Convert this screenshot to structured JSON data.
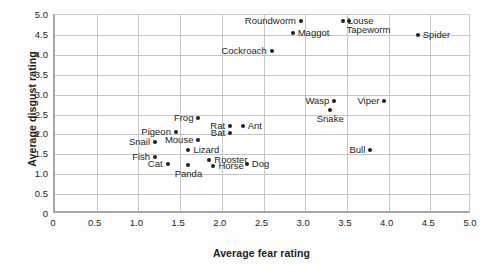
{
  "chart_data": {
    "type": "scatter",
    "title": "",
    "xlabel": "Average fear rating",
    "ylabel": "Average disgust rating",
    "xlim": [
      0,
      5.0
    ],
    "ylim": [
      0,
      5.0
    ],
    "grid": true,
    "legend": "none",
    "xticks": [
      "0",
      "0.5",
      "1.0",
      "1.5",
      "2.0",
      "2.5",
      "3.0",
      "3.5",
      "4.0",
      "4.5",
      "5.0"
    ],
    "xtick_values": [
      0,
      0.5,
      1.0,
      1.5,
      2.0,
      2.5,
      3.0,
      3.5,
      4.0,
      4.5,
      5.0
    ],
    "yticks": [
      "0",
      "0.5",
      "1.0",
      "1.5",
      "2.0",
      "2.5",
      "3.0",
      "3.5",
      "4.0",
      "4.5",
      "5.0"
    ],
    "ytick_values": [
      0,
      0.5,
      1.0,
      1.5,
      2.0,
      2.5,
      3.0,
      3.5,
      4.0,
      4.5,
      5.0
    ],
    "point_color": "#231f20",
    "points": [
      {
        "label": "Roundworm",
        "x": 2.95,
        "y": 4.85,
        "label_pos": "left"
      },
      {
        "label": "Louse",
        "x": 3.45,
        "y": 4.85,
        "label_pos": "right"
      },
      {
        "label": "Tapeworm",
        "x": 3.52,
        "y": 4.85,
        "label_pos": "below-right"
      },
      {
        "label": "Maggot",
        "x": 2.85,
        "y": 4.55,
        "label_pos": "right"
      },
      {
        "label": "Spider",
        "x": 4.35,
        "y": 4.5,
        "label_pos": "right"
      },
      {
        "label": "Cockroach",
        "x": 2.6,
        "y": 4.1,
        "label_pos": "left"
      },
      {
        "label": "Wasp",
        "x": 3.35,
        "y": 2.85,
        "label_pos": "left"
      },
      {
        "label": "Viper",
        "x": 3.95,
        "y": 2.85,
        "label_pos": "left"
      },
      {
        "label": "Snake",
        "x": 3.3,
        "y": 2.62,
        "label_pos": "below"
      },
      {
        "label": "Frog",
        "x": 1.72,
        "y": 2.4,
        "label_pos": "left"
      },
      {
        "label": "Rat",
        "x": 2.1,
        "y": 2.2,
        "label_pos": "left"
      },
      {
        "label": "Ant",
        "x": 2.25,
        "y": 2.2,
        "label_pos": "right"
      },
      {
        "label": "Bat",
        "x": 2.1,
        "y": 2.03,
        "label_pos": "left"
      },
      {
        "label": "Pigeon",
        "x": 1.45,
        "y": 2.05,
        "label_pos": "left"
      },
      {
        "label": "Mouse",
        "x": 1.72,
        "y": 1.85,
        "label_pos": "left"
      },
      {
        "label": "Snail",
        "x": 1.2,
        "y": 1.8,
        "label_pos": "left"
      },
      {
        "label": "Lizard",
        "x": 1.6,
        "y": 1.6,
        "label_pos": "right"
      },
      {
        "label": "Bull",
        "x": 3.78,
        "y": 1.6,
        "label_pos": "left"
      },
      {
        "label": "Fish",
        "x": 1.2,
        "y": 1.42,
        "label_pos": "left"
      },
      {
        "label": "Rooster",
        "x": 1.85,
        "y": 1.35,
        "label_pos": "right"
      },
      {
        "label": "Cat",
        "x": 1.35,
        "y": 1.25,
        "label_pos": "left"
      },
      {
        "label": "Dog",
        "x": 2.3,
        "y": 1.25,
        "label_pos": "right"
      },
      {
        "label": "Panda",
        "x": 1.6,
        "y": 1.22,
        "label_pos": "below"
      },
      {
        "label": "Horse",
        "x": 1.9,
        "y": 1.2,
        "label_pos": "right"
      }
    ]
  }
}
